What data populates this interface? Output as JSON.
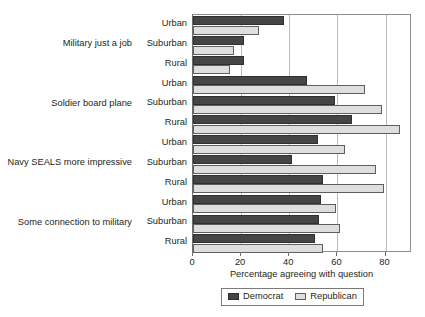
{
  "chart_data": {
    "type": "bar",
    "orientation": "horizontal",
    "title": "",
    "xlabel": "Percentage agreeing with question",
    "ylabel": "",
    "xlim": [
      0,
      91
    ],
    "xticks": [
      0,
      20,
      40,
      60,
      80
    ],
    "xtick_labels": [
      "0",
      "20",
      "40",
      "60",
      "80"
    ],
    "grid": true,
    "grid_axis": "x",
    "legend_position": "bottom",
    "groups": [
      {
        "label": "Military just a job",
        "subcategories": [
          "Urban",
          "Suburban",
          "Rural"
        ],
        "Democrat": [
          38,
          21,
          21
        ],
        "Republican": [
          27.5,
          17,
          15.5
        ]
      },
      {
        "label": "Soldier board plane",
        "subcategories": [
          "Urban",
          "Suburban",
          "Rural"
        ],
        "Democrat": [
          47.5,
          59,
          66
        ],
        "Republican": [
          71.5,
          78.5,
          86
        ]
      },
      {
        "label": "Navy SEALS more impressive",
        "subcategories": [
          "Urban",
          "Suburban",
          "Rural"
        ],
        "Democrat": [
          52,
          41,
          54
        ],
        "Republican": [
          63,
          76,
          79.5
        ]
      },
      {
        "label": "Some connection to military",
        "subcategories": [
          "Urban",
          "Suburban",
          "Rural"
        ],
        "Democrat": [
          53,
          52.5,
          50.5
        ],
        "Republican": [
          59.5,
          61,
          54
        ]
      }
    ],
    "series": [
      {
        "name": "Democrat",
        "color": "#454545",
        "values": [
          38,
          21,
          21,
          47.5,
          59,
          66,
          52,
          41,
          54,
          53,
          52.5,
          50.5
        ]
      },
      {
        "name": "Republican",
        "color": "#dedede",
        "values": [
          27.5,
          17,
          15.5,
          71.5,
          78.5,
          86,
          63,
          76,
          79.5,
          59.5,
          61,
          54
        ]
      }
    ],
    "categories": [
      "Military just a job - Urban",
      "Military just a job - Suburban",
      "Military just a job - Rural",
      "Soldier board plane - Urban",
      "Soldier board plane - Suburban",
      "Soldier board plane - Rural",
      "Navy SEALS more impressive - Urban",
      "Navy SEALS more impressive - Suburban",
      "Navy SEALS more impressive - Rural",
      "Some connection to military - Urban",
      "Some connection to military - Suburban",
      "Some connection to military - Rural"
    ]
  },
  "legend": {
    "entries": [
      {
        "label": "Democrat"
      },
      {
        "label": "Republican"
      }
    ]
  }
}
